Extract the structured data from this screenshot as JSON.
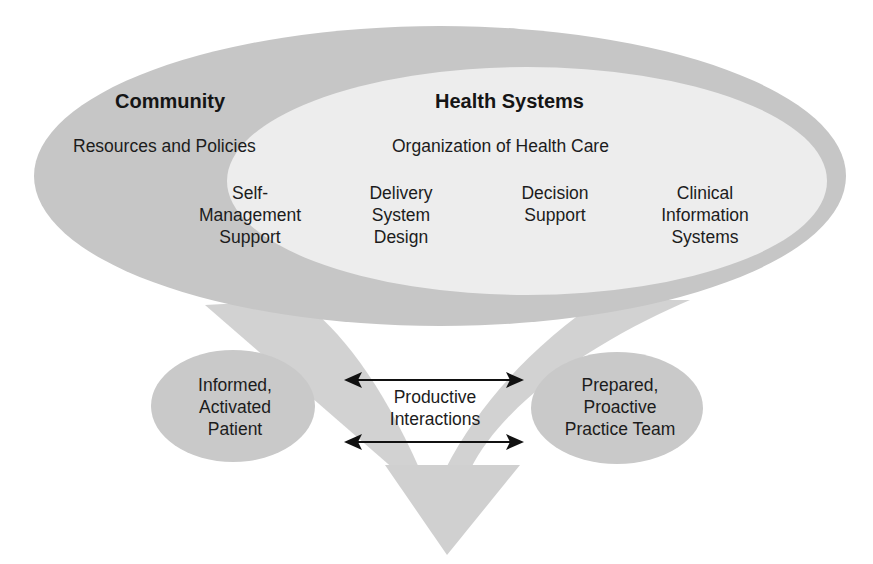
{
  "diagram": {
    "colors": {
      "outer_ellipse": "#c6c6c6",
      "inner_ellipse": "#eeeeee",
      "patient_ellipse": "#c9c9c9",
      "team_ellipse": "#c9c9c9",
      "flow_arrow": "#cfcfcf",
      "arrow_line": "#111111",
      "text": "#1c1c1c"
    },
    "community": {
      "title": "Community",
      "subtitle": "Resources and Policies",
      "items": [
        "Self-\nManagement\nSupport"
      ]
    },
    "health_systems": {
      "title": "Health Systems",
      "subtitle": "Organization of Health Care",
      "items": [
        "Delivery\nSystem\nDesign",
        "Decision\nSupport",
        "Clinical\nInformation\nSystems"
      ]
    },
    "patient": {
      "label": "Informed,\nActivated\nPatient"
    },
    "team": {
      "label": "Prepared,\nProactive\nPractice Team"
    },
    "interactions": {
      "label": "Productive\nInteractions"
    }
  }
}
